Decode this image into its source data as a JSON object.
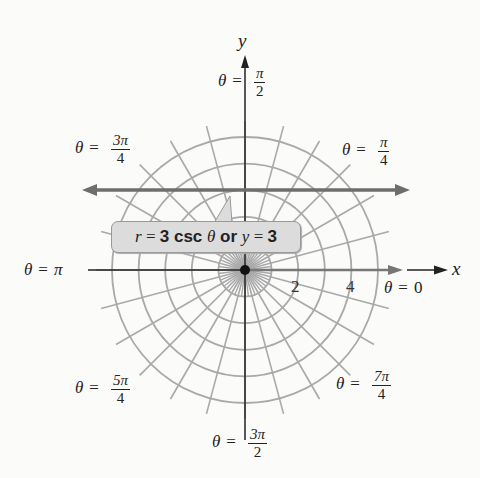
{
  "chart_data": {
    "type": "polar-graph",
    "title": "",
    "curve": {
      "equation_polar": "r = 3 csc θ",
      "equation_rect": "y = 3",
      "line_y": 3
    },
    "grid": {
      "circles_r": [
        1,
        2,
        3,
        4,
        5
      ],
      "ray_step_deg": 15,
      "inner_ray_step_deg": 7.5
    },
    "radial_tick_labels": [
      "2",
      "4"
    ],
    "axes": {
      "x_label": "x",
      "y_label": "y"
    },
    "angle_labels": [
      {
        "theta": "π/2",
        "num": "π",
        "den": "2"
      },
      {
        "theta": "3π/4",
        "num": "3π",
        "den": "4"
      },
      {
        "theta": "π/4",
        "num": "π",
        "den": "4"
      },
      {
        "theta": "π"
      },
      {
        "theta": "0"
      },
      {
        "theta": "5π/4",
        "num": "5π",
        "den": "4"
      },
      {
        "theta": "7π/4",
        "num": "7π",
        "den": "4"
      },
      {
        "theta": "3π/2",
        "num": "3π",
        "den": "2"
      }
    ]
  },
  "labels": {
    "theta": "θ",
    "eq": "=",
    "pi": "π",
    "zero": "0",
    "x": "x",
    "y": "y",
    "tick2": "2",
    "tick4": "4",
    "pi2_num": "π",
    "pi2_den": "2",
    "pi34_num": "3π",
    "pi34_den": "4",
    "pi4_num": "π",
    "pi4_den": "4",
    "pi54_num": "5π",
    "pi54_den": "4",
    "pi74_num": "7π",
    "pi74_den": "4",
    "pi32_num": "3π",
    "pi32_den": "2"
  },
  "callout": {
    "r": "r",
    "eq1": " = ",
    "three1": "3",
    "csc": " csc ",
    "theta": "θ",
    "or": " or ",
    "y": "y",
    "eq2": " = ",
    "three2": "3"
  },
  "colors": {
    "grid": "#a9a9a9",
    "line": "#6e6e6e",
    "axis": "#222222",
    "callout_bg": "#dcdcdc"
  }
}
